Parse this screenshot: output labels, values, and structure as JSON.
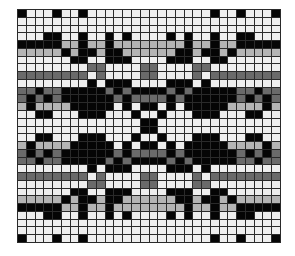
{
  "grid": {
    "cols": 30,
    "rows": 30,
    "symmetry": "mirror-horizontal-and-vertical",
    "palette": {
      "W": "#eeeeee",
      "L": "#b4b4b4",
      "D": "#6a6a6a",
      "B": "#050505"
    },
    "quadrant_rows": [
      "BWWWBWWBWWWWWWW",
      "WWWWWWWWWWWWWWW",
      "WWWWWWWWWWWWWWW",
      "WWWBBWWBWWBWBWW",
      "BBBBBLLBLLBLLLL",
      "LLLLLBLBBLBBLLL",
      "WWWWWWBBWWBBBWW",
      "WWWWWWWWDDWWWWD",
      "DDDDDDDDWDWWWWD",
      "WWWWWWWWBWBBBWW",
      "DDBDDBBBBBDBDBB",
      "DBDBDBBBBBBDBDD",
      "LBLLLLBBBBBWBWB",
      "WWBBWWWBBBWWWBW",
      "WWWWWWWWWWWWWWB"
    ]
  }
}
